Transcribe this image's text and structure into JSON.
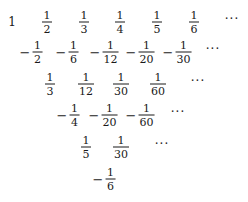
{
  "rows": [
    {
      "y": 22,
      "entries": [
        {
          "x": 12,
          "type": "whole",
          "value": "1"
        },
        {
          "x": 47,
          "sign": "",
          "num": "1",
          "den": "2"
        },
        {
          "x": 84,
          "sign": "",
          "num": "1",
          "den": "3"
        },
        {
          "x": 120,
          "sign": "",
          "num": "1",
          "den": "4"
        },
        {
          "x": 157,
          "sign": "",
          "num": "1",
          "den": "5"
        },
        {
          "x": 194,
          "sign": "",
          "num": "1",
          "den": "6"
        }
      ],
      "ellipsis_x": 232
    },
    {
      "y": 52,
      "entries": [
        {
          "x": 31,
          "sign": "−",
          "num": "1",
          "den": "2"
        },
        {
          "x": 67,
          "sign": "−",
          "num": "1",
          "den": "6"
        },
        {
          "x": 104,
          "sign": "−",
          "num": "1",
          "den": "12"
        },
        {
          "x": 140,
          "sign": "−",
          "num": "1",
          "den": "20"
        },
        {
          "x": 177,
          "sign": "−",
          "num": "1",
          "den": "30"
        }
      ],
      "ellipsis_x": 213
    },
    {
      "y": 84,
      "entries": [
        {
          "x": 50,
          "sign": "",
          "num": "1",
          "den": "3"
        },
        {
          "x": 86,
          "sign": "",
          "num": "1",
          "den": "12"
        },
        {
          "x": 121,
          "sign": "",
          "num": "1",
          "den": "30"
        },
        {
          "x": 158,
          "sign": "",
          "num": "1",
          "den": "60"
        }
      ],
      "ellipsis_x": 198
    },
    {
      "y": 115,
      "entries": [
        {
          "x": 68,
          "sign": "−",
          "num": "1",
          "den": "4"
        },
        {
          "x": 103,
          "sign": "−",
          "num": "1",
          "den": "20"
        },
        {
          "x": 140,
          "sign": "−",
          "num": "1",
          "den": "60"
        }
      ],
      "ellipsis_x": 178
    },
    {
      "y": 147,
      "entries": [
        {
          "x": 86,
          "sign": "",
          "num": "1",
          "den": "5"
        },
        {
          "x": 121,
          "sign": "",
          "num": "1",
          "den": "30"
        }
      ],
      "ellipsis_x": 162
    },
    {
      "y": 179,
      "entries": [
        {
          "x": 104,
          "sign": "−",
          "num": "1",
          "den": "6"
        }
      ],
      "ellipsis_x": null
    }
  ],
  "ellipsis": "···"
}
